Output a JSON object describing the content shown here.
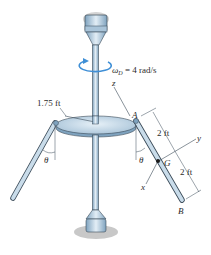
{
  "diagram": {
    "type": "rigid-body dynamics figure",
    "labels": {
      "angular_velocity": "ωD = 4 rad/s",
      "omega_symbol": "ω",
      "omega_sub": "D",
      "omega_value": " = 4 rad/s",
      "disk_radius": "1.75 ft",
      "point_a": "A",
      "point_b": "B",
      "point_g": "G",
      "axis_x": "x",
      "axis_y": "y",
      "axis_z": "z",
      "dim_upper": "2 ft",
      "dim_lower": "2 ft",
      "angle_left": "θ",
      "angle_right": "θ"
    },
    "colors": {
      "body_fill": "#c9dcea",
      "body_dark": "#7fa3bf",
      "outline": "#3a4a58",
      "rotation_arrow": "#3f8fd6",
      "shadow": "#c8c8c8",
      "text": "#2a2a2a"
    }
  }
}
